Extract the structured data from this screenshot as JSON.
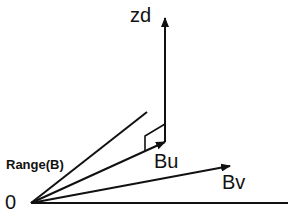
{
  "diagram": {
    "labels": {
      "zd": "zd",
      "range": "Range(B)",
      "bu": "Bu",
      "bv": "Bv",
      "origin": "0"
    },
    "colors": {
      "stroke": "#111111",
      "background": "#ffffff"
    },
    "vectors": [
      {
        "name": "zd",
        "from": [
          165,
          124
        ],
        "to": [
          165,
          18
        ],
        "arrow": true
      },
      {
        "name": "Bu",
        "from": [
          31,
          203
        ],
        "to": [
          165,
          142
        ],
        "arrow": true
      },
      {
        "name": "Bv",
        "from": [
          31,
          203
        ],
        "to": [
          230,
          166
        ],
        "arrow": true
      },
      {
        "name": "Range(B)",
        "from": [
          31,
          203
        ],
        "to": [
          147,
          112
        ],
        "arrow": false
      },
      {
        "name": "baseline",
        "from": [
          31,
          203
        ],
        "to": [
          288,
          203
        ],
        "arrow": false
      }
    ]
  }
}
